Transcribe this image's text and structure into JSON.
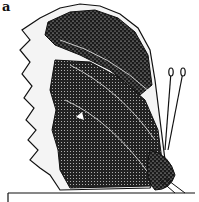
{
  "figure": {
    "caption_fragment": "a",
    "style": "pen-and-ink stipple illustration",
    "colors": {
      "ink": "#111111",
      "paper": "#ffffff"
    }
  }
}
